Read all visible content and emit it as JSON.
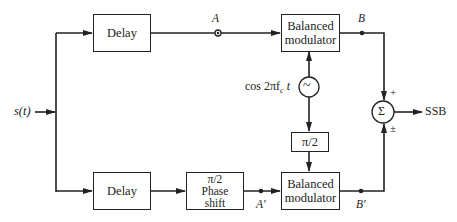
{
  "diagram": {
    "input": {
      "label": "s(t)"
    },
    "output": {
      "label": "SSB"
    },
    "blocks": {
      "delay_top": {
        "label": "Delay"
      },
      "delay_bottom": {
        "label": "Delay"
      },
      "phase_shift": {
        "line1": "π/2",
        "line2": "Phase",
        "line3": "shift"
      },
      "mod_top": {
        "line1": "Balanced",
        "line2": "modulator"
      },
      "mod_bottom": {
        "line1": "Balanced",
        "line2": "modulator"
      },
      "carrier_shift": {
        "label": "π/2"
      },
      "oscillator": {
        "symbol": "~",
        "label": "cos 2πf",
        "subscript": "c",
        "suffix": " t"
      },
      "summer": {
        "symbol": "Σ",
        "sign_top": "+",
        "sign_bottom": "±"
      }
    },
    "nodes": {
      "A": "A",
      "B": "B",
      "A_prime": "A′",
      "B_prime": "B′"
    },
    "colors": {
      "line": "#222222",
      "background": "#ffffff"
    }
  }
}
